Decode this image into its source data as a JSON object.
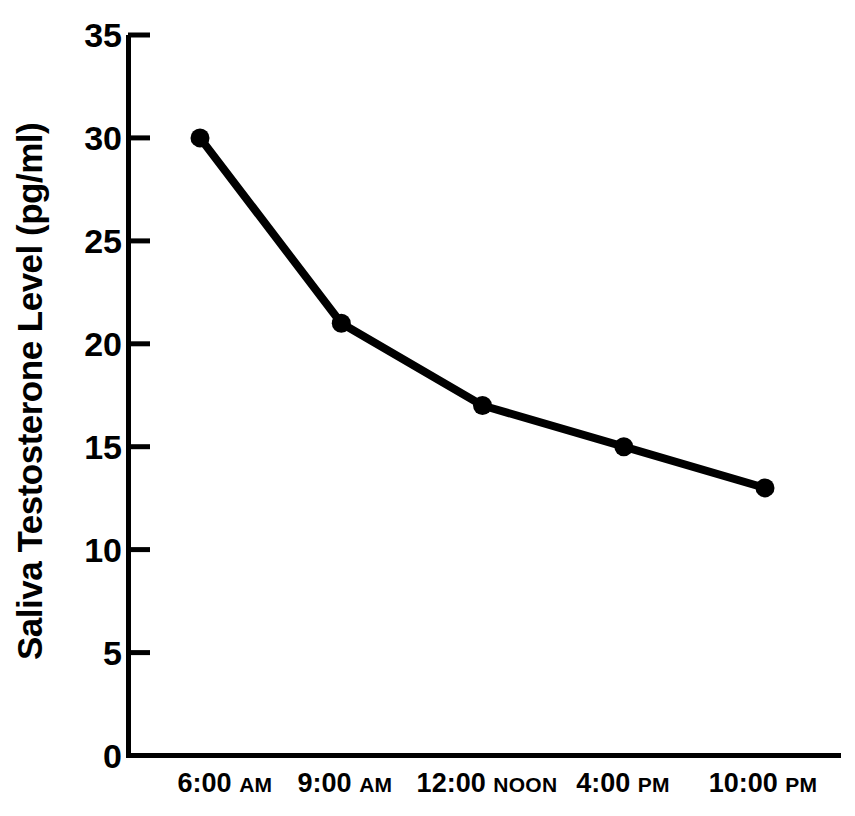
{
  "chart_data": {
    "type": "line",
    "title": "",
    "xlabel": "",
    "ylabel": "Saliva Testosterone Level (pg/ml)",
    "categories": [
      "6:00 AM",
      "9:00 AM",
      "12:00 NOON",
      "4:00 PM",
      "10:00 PM"
    ],
    "category_parts": [
      {
        "time": "6:00",
        "suffix": "AM"
      },
      {
        "time": "9:00",
        "suffix": "AM"
      },
      {
        "time": "12:00",
        "suffix": "NOON"
      },
      {
        "time": "4:00",
        "suffix": "PM"
      },
      {
        "time": "10:00",
        "suffix": "PM"
      }
    ],
    "values": [
      30,
      21,
      17,
      15,
      13
    ],
    "series": [
      {
        "name": "Saliva Testosterone Level",
        "values": [
          30,
          21,
          17,
          15,
          13
        ]
      }
    ],
    "ylim": [
      0,
      35
    ],
    "yticks": [
      0,
      5,
      10,
      15,
      20,
      25,
      30,
      35
    ],
    "ytick_labels": [
      "0",
      "5",
      "10",
      "15",
      "20",
      "25",
      "30",
      "35"
    ],
    "grid": false,
    "legend": false,
    "legend_position": "none",
    "marker": "filled-circle",
    "line_color": "#000000",
    "marker_color": "#000000",
    "axis_color": "#000000",
    "background_color": "#ffffff"
  }
}
